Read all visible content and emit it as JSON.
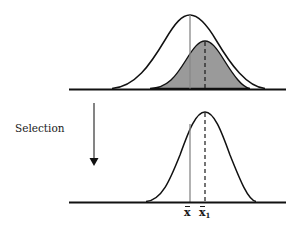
{
  "figure": {
    "type": "selection-response-diagram",
    "top_panel": {
      "population_curve": {
        "peak_x": 190,
        "peak_y": 15,
        "start_x": 112,
        "end_x": 265,
        "fill": "none"
      },
      "selected_curve": {
        "peak_x": 205,
        "peak_y": 41,
        "start_x": 150,
        "end_x": 250,
        "fill": "#9a9a9a"
      },
      "mean_line": {
        "x": 190,
        "style": "solid",
        "color": "#888888"
      },
      "selected_mean_line": {
        "x": 205,
        "style": "dashed",
        "color": "#1a1a1a"
      },
      "axis": {
        "y": 89,
        "x1": 69,
        "x2": 286
      }
    },
    "arrow": {
      "label": "Selection",
      "direction": "down",
      "x": 94,
      "y1": 103,
      "y2": 165
    },
    "bottom_panel": {
      "offspring_curve": {
        "peak_x": 205,
        "peak_y": 112,
        "start_x": 146,
        "end_x": 256,
        "fill": "none"
      },
      "mean_line": {
        "x": 190,
        "style": "solid",
        "color": "#888888"
      },
      "offspring_mean_line": {
        "x": 205,
        "style": "dashed",
        "color": "#1a1a1a"
      },
      "axis": {
        "y": 202,
        "x1": 69,
        "x2": 286
      }
    },
    "labels": {
      "mean": {
        "base": "x",
        "accent": "bar",
        "subscript": ""
      },
      "mean_1": {
        "base": "x",
        "accent": "bar",
        "subscript": "1"
      }
    }
  }
}
